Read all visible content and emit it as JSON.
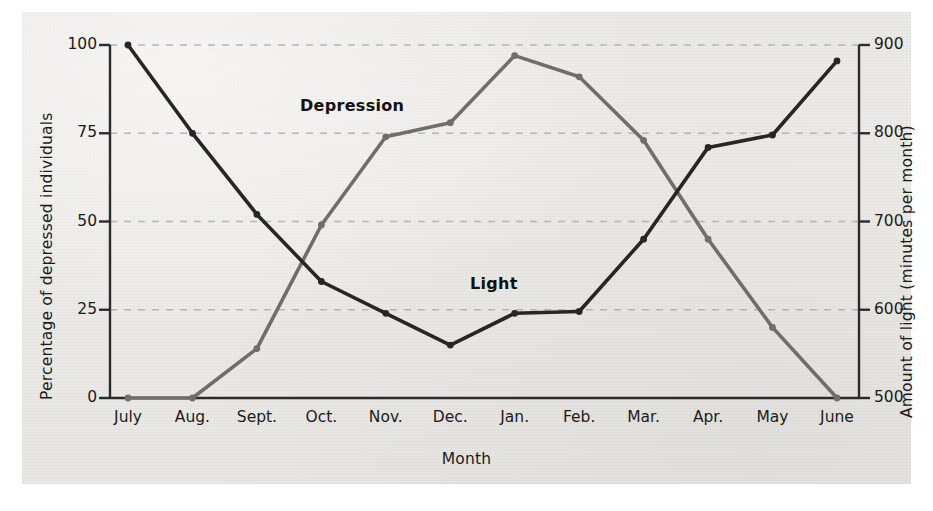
{
  "chart_data": {
    "type": "line",
    "title": "",
    "xlabel": "Month",
    "categories": [
      "July",
      "Aug.",
      "Sept.",
      "Oct.",
      "Nov.",
      "Dec.",
      "Jan.",
      "Feb.",
      "Mar.",
      "Apr.",
      "May",
      "June"
    ],
    "grid": true,
    "legend": "inline-labels",
    "axes": {
      "left": {
        "label": "Percentage of depressed individuals",
        "ticks": [
          "0",
          "25",
          "50",
          "75",
          "100"
        ],
        "tick_values": [
          0,
          25,
          50,
          75,
          100
        ],
        "lim": [
          0,
          100
        ]
      },
      "right": {
        "label": "Amount of light (minutes per month)",
        "ticks": [
          "500",
          "600",
          "700",
          "800",
          "900"
        ],
        "tick_values": [
          500,
          600,
          700,
          800,
          900
        ],
        "lim": [
          500,
          900
        ]
      }
    },
    "series": [
      {
        "name": "Depression",
        "axis": "left",
        "color": "#6e6e6e",
        "unit": "percent",
        "values": [
          0,
          0,
          14,
          49,
          74,
          78,
          97,
          91,
          73,
          45,
          20,
          0
        ]
      },
      {
        "name": "Light",
        "axis": "right",
        "color": "#262626",
        "unit": "minutes per month",
        "values": [
          900,
          800,
          708,
          632,
          596,
          560,
          596,
          598,
          680,
          784,
          798,
          882
        ],
        "values_as_left_percent": [
          100,
          75,
          52,
          33,
          24,
          15,
          24,
          24.5,
          45,
          71,
          74.5,
          95.5
        ]
      }
    ],
    "annotations": [
      {
        "text": "Depression",
        "series": "Depression"
      },
      {
        "text": "Light",
        "series": "Light"
      }
    ]
  },
  "colors": {
    "depression": "#6e6e6e",
    "light": "#262626",
    "grid": "#9aa7b4",
    "axis": "#2b2b2b",
    "paper": "#ecebe7"
  }
}
